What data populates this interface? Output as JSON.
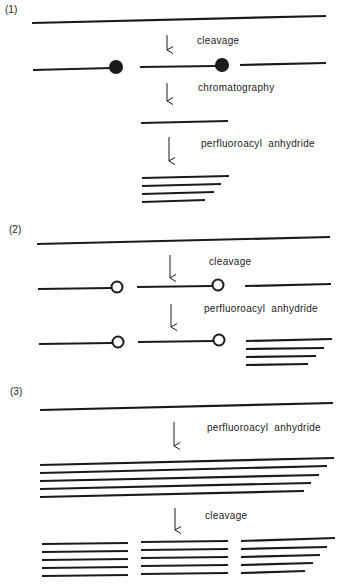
{
  "figure": {
    "sections": [
      {
        "label": "(1)",
        "steps": [
          "cleavage",
          "chromatography",
          "perfluoroacyl  anhydride"
        ],
        "marker_style": "filled-circle"
      },
      {
        "label": "(2)",
        "steps": [
          "cleavage",
          "perfluoroacyl  anhydride"
        ],
        "marker_style": "open-circle"
      },
      {
        "label": "(3)",
        "steps": [
          "perfluoroacyl  anhydride",
          "cleavage"
        ],
        "marker_style": "none"
      }
    ],
    "colors": {
      "line": "#1a1a1a",
      "text": "#222222",
      "background": "#ffffff"
    }
  }
}
